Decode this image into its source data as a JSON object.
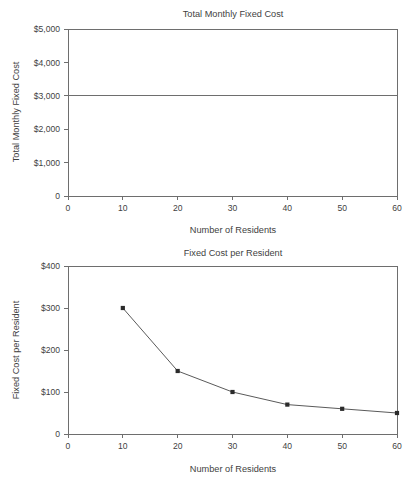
{
  "chart_data": [
    {
      "type": "line",
      "title": "Total Monthly Fixed Cost",
      "xlabel": "Number of Residents",
      "ylabel": "Total Monthly Fixed Cost",
      "x": [
        0,
        60
      ],
      "values": [
        3000,
        3000
      ],
      "categories": [
        "0",
        "10",
        "20",
        "30",
        "40",
        "50",
        "60"
      ],
      "xticks": [
        0,
        10,
        20,
        30,
        40,
        50,
        60
      ],
      "xticklabels": [
        "0",
        "10",
        "20",
        "30",
        "40",
        "50",
        "60"
      ],
      "yticks": [
        0,
        1000,
        2000,
        3000,
        4000,
        5000
      ],
      "yticklabels": [
        "0",
        "$1,000",
        "$2,000",
        "$3,000",
        "$4,000",
        "$5,000"
      ],
      "xlim": [
        0,
        60
      ],
      "ylim": [
        0,
        5000
      ],
      "grid": false,
      "legend": "none",
      "markers": false,
      "line_color": "#6e6e6e",
      "note": "Total fixed cost is constant at $3,000 across all resident counts"
    },
    {
      "type": "line",
      "title": "Fixed Cost per Resident",
      "xlabel": "Number of Residents",
      "ylabel": "Fixed Cost per Resident",
      "x": [
        10,
        20,
        30,
        40,
        50,
        60
      ],
      "values": [
        300,
        150,
        100,
        70,
        60,
        50
      ],
      "categories": [
        "10",
        "20",
        "30",
        "40",
        "50",
        "60"
      ],
      "xticks": [
        0,
        10,
        20,
        30,
        40,
        50,
        60
      ],
      "xticklabels": [
        "0",
        "10",
        "20",
        "30",
        "40",
        "50",
        "60"
      ],
      "yticks": [
        0,
        100,
        200,
        300,
        400
      ],
      "yticklabels": [
        "0",
        "$100",
        "$200",
        "$300",
        "$400"
      ],
      "xlim": [
        0,
        60
      ],
      "ylim": [
        0,
        400
      ],
      "grid": false,
      "legend": "none",
      "markers": true,
      "marker_style": "square",
      "line_color": "#5a5a5a",
      "marker_color": "#2b2b2b",
      "note": "Fixed cost per resident declines as residents increase ($3,000 divided by residents)"
    }
  ]
}
